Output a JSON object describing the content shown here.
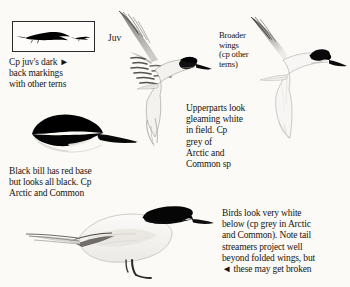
{
  "page": {
    "background_color": "#fbfaf7",
    "ink_color": "#17140f",
    "width": 350,
    "height": 287
  },
  "labels": {
    "juv": "Juv"
  },
  "notes": {
    "juv_box": "Cp juv's dark ►\nback markings\nwith other terns",
    "broader_wings": "Broader\nwings\n(cp other\nterns)",
    "upperparts": "Upperparts look\ngleaming white\nin field. Cp\ngrey of\nArctic and\nCommon sp",
    "black_bill": "Black bill has red base\nbut looks all black. Cp\nArctic and Common",
    "below": "Birds look very white\nbelow (cp grey in Arctic\nand Common). Note tail\nstreamers project well\nbeyond folded wings, but\n◄ these may get broken"
  },
  "figures": {
    "silhouette_box": {
      "name": "juvenile-silhouette-box",
      "description": "black perched tern silhouette with smaller silhouette at right"
    },
    "juvenile_flight": {
      "name": "juvenile-tern-in-flight",
      "description": "juvenile tern in flight showing barred upperwing markings and dark cap"
    },
    "adult_flight": {
      "name": "adult-tern-in-flight",
      "description": "adult tern in flight, gleaming white with black cap and heavy black bill"
    },
    "head_study": {
      "name": "tern-head-study",
      "description": "head profile with black cap and stout all-black bill"
    },
    "perched": {
      "name": "perched-tern",
      "description": "perched adult tern with long tail streamers and black legs"
    }
  }
}
